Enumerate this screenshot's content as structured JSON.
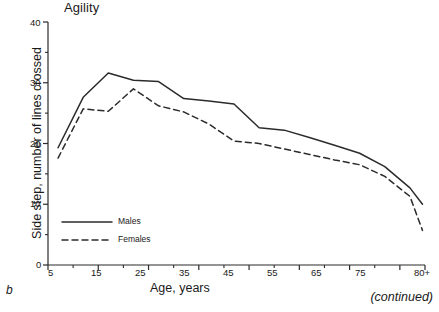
{
  "figure": {
    "panel_letter": "b",
    "continued_note": "(continued)"
  },
  "chart_data": {
    "type": "line",
    "title": "Agility",
    "xlabel": "Age, years",
    "ylabel": "Side step, number of lines crossed",
    "xlim": [
      5,
      80
    ],
    "ylim": [
      0,
      40
    ],
    "grid": false,
    "legend_position": "lower-left",
    "x_major_ticks": [
      5,
      15,
      25,
      35,
      45,
      55,
      65,
      75,
      80
    ],
    "x_tick_labels": [
      "5",
      "15",
      "25",
      "35",
      "45",
      "55",
      "65",
      "75",
      "80+"
    ],
    "x_minor_ticks": [
      10,
      20,
      30,
      40,
      50,
      60,
      70
    ],
    "y_major_ticks": [
      0,
      10,
      20,
      30,
      40
    ],
    "y_tick_labels": [
      "0",
      "10",
      "20",
      "30",
      "40"
    ],
    "y_minor_ticks": [
      5,
      15,
      25,
      35
    ],
    "x": [
      7,
      12,
      17,
      22,
      27,
      32,
      37,
      42,
      47,
      52,
      57,
      62,
      67,
      72,
      77,
      79.5
    ],
    "series": [
      {
        "name": "Males",
        "style": "solid",
        "color": "#2b2b2b",
        "values": [
          19.3,
          27.6,
          31.6,
          30.4,
          30.2,
          27.4,
          27.0,
          26.5,
          22.6,
          22.2,
          21.0,
          19.7,
          18.4,
          16.2,
          12.7,
          10.0
        ]
      },
      {
        "name": "Females",
        "style": "dashed",
        "color": "#2b2b2b",
        "values": [
          17.6,
          25.7,
          25.3,
          29.0,
          26.2,
          25.2,
          23.2,
          20.4,
          20.0,
          19.1,
          18.2,
          17.3,
          16.5,
          14.6,
          11.3,
          5.7
        ]
      }
    ],
    "legend": [
      {
        "label": "Males",
        "style": "solid"
      },
      {
        "label": "Females",
        "style": "dashed"
      }
    ]
  }
}
